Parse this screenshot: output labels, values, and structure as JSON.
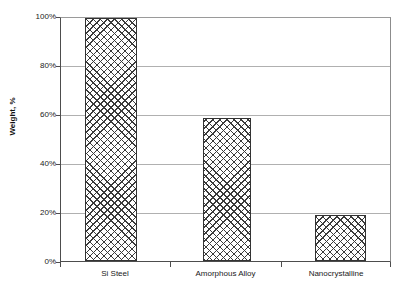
{
  "chart_data": {
    "type": "bar",
    "title": "",
    "subtitle": "",
    "xlabel": "",
    "ylabel": "Weight, %",
    "categories": [
      "Si Steel",
      "Amorphous Alloy",
      "Nanocrystalline"
    ],
    "values": [
      100,
      59,
      19
    ],
    "value_labels": [
      "100%",
      "59%",
      "19%"
    ],
    "ylim": [
      0,
      100
    ],
    "ytick_values": [
      0,
      20,
      40,
      60,
      80,
      100
    ],
    "ytick_labels": [
      "0%",
      "20%",
      "40%",
      "60%",
      "80%",
      "100%"
    ],
    "grid": "horizontal",
    "legend": "none",
    "series": [
      {
        "name": "Weight",
        "values": [
          100,
          59,
          19
        ]
      }
    ],
    "bar_style": {
      "fill": "crosshatch",
      "fill_color": "#3a3a3a",
      "background_color": "#ffffff",
      "border_color": "#333333"
    },
    "annotations": []
  },
  "axes": {
    "y": {
      "label": "Weight, %",
      "ticks": [
        {
          "label": "100%",
          "value": 100
        },
        {
          "label": "80%",
          "value": 80
        },
        {
          "label": "60%",
          "value": 60
        },
        {
          "label": "40%",
          "value": 40
        },
        {
          "label": "20%",
          "value": 20
        },
        {
          "label": "0%",
          "value": 0
        }
      ]
    },
    "x": {
      "label": "",
      "categories": [
        {
          "label": "Si Steel"
        },
        {
          "label": "Amorphous Alloy"
        },
        {
          "label": "Nanocrystalline"
        }
      ]
    }
  },
  "colors": {
    "grid": "#b0b0b0",
    "axis": "#4d4d4d",
    "hatch": "#3a3a3a",
    "text": "#1a1a1a",
    "plot_background": "#ffffff"
  }
}
